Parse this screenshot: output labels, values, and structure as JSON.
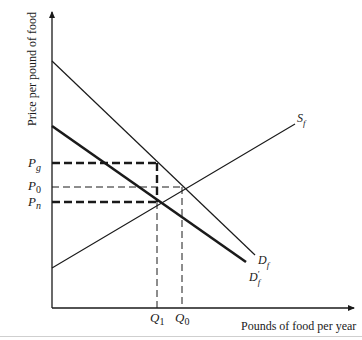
{
  "diagram": {
    "type": "supply-demand",
    "axes": {
      "y_label": "Price per pound of food",
      "x_label": "Pounds of food per year"
    },
    "curves": {
      "supply": {
        "label": "S",
        "subscript": "f"
      },
      "demand": {
        "label": "D",
        "subscript": "f"
      },
      "demand_shifted": {
        "label": "D",
        "subscript": "f",
        "prime": "′"
      }
    },
    "price_levels": {
      "pg": {
        "label": "P",
        "subscript": "g"
      },
      "p0": {
        "label": "P",
        "subscript": "0"
      },
      "pn": {
        "label": "P",
        "subscript": "n"
      }
    },
    "quantity_levels": {
      "q1": {
        "label": "Q",
        "subscript": "1"
      },
      "q0": {
        "label": "Q",
        "subscript": "0"
      }
    },
    "colors": {
      "ink": "#1a1a1a",
      "background": "#ffffff"
    }
  }
}
